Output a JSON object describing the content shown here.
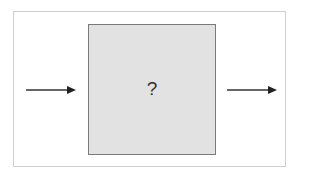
{
  "diagram": {
    "type": "black-box",
    "box": {
      "label": "?",
      "fill": "#e2e2e2",
      "stroke": "#7a7a7a"
    },
    "input_arrow": {
      "direction": "right",
      "color": "#333333"
    },
    "output_arrow": {
      "direction": "right",
      "color": "#333333"
    },
    "frame": {
      "stroke": "#cfcfcf"
    }
  }
}
